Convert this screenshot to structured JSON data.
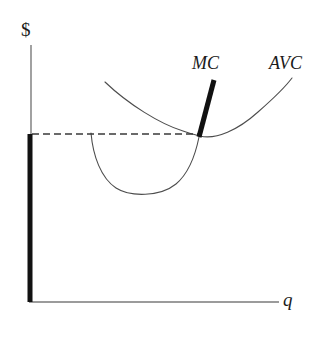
{
  "figure": {
    "background_color": "#ffffff",
    "width": 324,
    "height": 340
  },
  "axes": {
    "y_label": "$",
    "x_label": "q",
    "axis_color": "#7a7a7a",
    "origin": {
      "x": 31,
      "y": 302
    },
    "y_axis_top": {
      "x": 31,
      "y": 45
    },
    "x_axis_right": {
      "x": 279,
      "y": 302
    }
  },
  "curves": {
    "avc": {
      "label": "AVC",
      "color": "#4d4d4d",
      "stroke_width": 1.1,
      "label_position": {
        "x": 269,
        "y": 54
      },
      "path": "M 105,82 C 128,104 160,124 183,131 C 191,134 196,135 200,136 C 216,140 238,130 258,112 C 274,98 286,86 292,78"
    },
    "mc_curve": {
      "label": "MC",
      "color": "#4d4d4d",
      "stroke_width": 1.1,
      "label_position": {
        "x": 192,
        "y": 54
      },
      "path": "M 91,133 C 93,156 101,178 116,188 C 130,197 160,197 176,184 C 189,173 196,152 199,137"
    },
    "mc_segment": {
      "color": "#111111",
      "stroke_width": 5,
      "start": {
        "x": 214,
        "y": 80
      },
      "end": {
        "x": 199,
        "y": 137
      }
    }
  },
  "annotations": {
    "price_line": {
      "name": "shutdown-price-dashed-line",
      "color": "#3a3a3a",
      "stroke_width": 1.6,
      "dash_pattern": "7,4",
      "start": {
        "x": 32,
        "y": 134
      },
      "end": {
        "x": 199,
        "y": 134
      }
    },
    "supply_segment": {
      "name": "vertical-supply-segment",
      "color": "#111111",
      "stroke_width": 5,
      "start": {
        "x": 30,
        "y": 134
      },
      "end": {
        "x": 30,
        "y": 302
      }
    },
    "intersection_point": {
      "name": "mc-avc-minimum-intersection",
      "x": 199,
      "y": 136
    }
  },
  "chart_data": {
    "type": "line",
    "title": "",
    "xlabel": "q",
    "ylabel": "$",
    "grid": false,
    "legend": "inline-curve-labels",
    "series": [
      {
        "name": "AVC",
        "description": "U-shaped average variable cost curve, minimum coincides with MC crossing at the shutdown price",
        "points": [
          [
            105,
            82
          ],
          [
            130,
            106
          ],
          [
            155,
            121
          ],
          [
            180,
            130
          ],
          [
            199,
            136
          ],
          [
            225,
            138
          ],
          [
            250,
            120
          ],
          [
            272,
            100
          ],
          [
            292,
            78
          ]
        ]
      },
      {
        "name": "MC",
        "description": "Marginal cost curve; the thick upper portion above AVC minimum is the firm's supply curve",
        "points": [
          [
            91,
            133
          ],
          [
            100,
            166
          ],
          [
            116,
            188
          ],
          [
            145,
            193
          ],
          [
            176,
            184
          ],
          [
            199,
            137
          ],
          [
            206,
            112
          ],
          [
            214,
            80
          ]
        ]
      },
      {
        "name": "Supply segment (vertical at q=0)",
        "description": "Thick vertical segment along the price axis below the shutdown price",
        "points": [
          [
            30,
            134
          ],
          [
            30,
            302
          ]
        ]
      },
      {
        "name": "Shutdown price line",
        "description": "Horizontal dashed line at the minimum of AVC",
        "points": [
          [
            32,
            134
          ],
          [
            199,
            134
          ]
        ]
      }
    ],
    "annotations": [
      {
        "text": "MC",
        "x": 207,
        "y": 65
      },
      {
        "text": "AVC",
        "x": 292,
        "y": 65
      },
      {
        "text": "$",
        "x": 28,
        "y": 30
      },
      {
        "text": "q",
        "x": 288,
        "y": 300
      }
    ]
  }
}
